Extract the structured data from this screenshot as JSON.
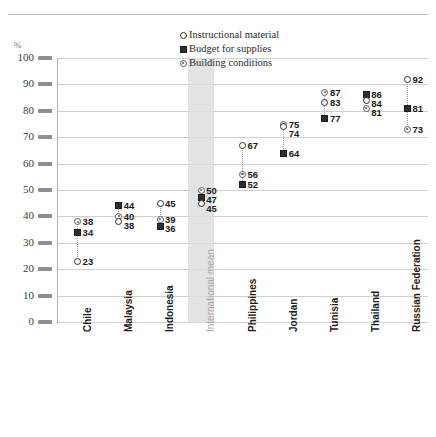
{
  "chart_data": {
    "type": "scatter",
    "title": "",
    "xlabel": "",
    "ylabel": "%",
    "ylim": [
      0,
      100
    ],
    "ytick_step": 10,
    "yticks": [
      "0",
      "10",
      "20",
      "30",
      "40",
      "50",
      "60",
      "70",
      "80",
      "90",
      "100"
    ],
    "grid": true,
    "legend_position": "top-center",
    "legend": [
      {
        "name": "Instructional material",
        "marker": "open-circle"
      },
      {
        "name": "Budget for supplies",
        "marker": "square"
      },
      {
        "name": "Building conditions",
        "marker": "dot-circle"
      }
    ],
    "categories": [
      "Chile",
      "Malaysia",
      "Indonesia",
      "International mean",
      "Philippines",
      "Jordan",
      "Tunisia",
      "Thailand",
      "Russian Federation"
    ],
    "highlighted_category": "International mean",
    "series": [
      {
        "name": "Instructional material",
        "marker": "open-circle",
        "values": [
          23,
          38,
          45,
          45,
          67,
          74,
          83,
          84,
          92
        ]
      },
      {
        "name": "Budget for supplies",
        "marker": "square",
        "values": [
          34,
          44,
          36,
          47,
          52,
          64,
          77,
          86,
          81
        ]
      },
      {
        "name": "Building conditions",
        "marker": "dot-circle",
        "values": [
          38,
          40,
          39,
          50,
          56,
          75,
          87,
          81,
          73
        ]
      }
    ],
    "point_labels": {
      "Chile": [
        "38",
        "34",
        "23"
      ],
      "Malaysia": [
        "44",
        "40",
        "38"
      ],
      "Indonesia": [
        "45",
        "39",
        "36"
      ],
      "International mean": [
        "50",
        "47",
        "45"
      ],
      "Philippines": [
        "67",
        "56",
        "52"
      ],
      "Jordan": [
        "75",
        "74",
        "64"
      ],
      "Tunisia": [
        "87",
        "83",
        "77"
      ],
      "Thailand": [
        "84",
        "86",
        "81"
      ],
      "Russian Federation": [
        "92",
        "81",
        "73"
      ]
    }
  },
  "axis": {
    "unit_label": "%"
  },
  "colors": {
    "gridline": "#cfcfcf",
    "tick": "#8e8e8e",
    "marker_dark": "#2e2e2e",
    "marker_mid": "#5b5b5b",
    "mean_band": "#dedede",
    "mean_label": "#a8a8a8",
    "top_rule": "#b9b9b9"
  }
}
